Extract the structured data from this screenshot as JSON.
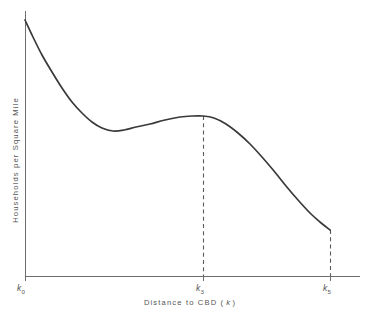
{
  "chart_data": {
    "type": "line",
    "title": "",
    "xlabel": "Distance to CBD ( k )",
    "xlabel_main": "Distance to CBD (",
    "xlabel_symbol": "k",
    "xlabel_close": ")",
    "ylabel": "Households per Square Mile",
    "grid": false,
    "legend": "none",
    "xticks": [
      {
        "label": "k",
        "sub": "0",
        "x_px": 25
      },
      {
        "label": "k",
        "sub": "3",
        "x_px": 203
      },
      {
        "label": "k",
        "sub": "5",
        "x_px": 330
      }
    ],
    "yticks": [],
    "xlim": [
      0,
      5
    ],
    "ylim": [
      0,
      100
    ],
    "annotations": [
      {
        "name": "k3-drop-line",
        "style": "dashed-vertical",
        "x_px": 203,
        "y_top_px": 116,
        "y_bottom_px": 276
      },
      {
        "name": "k5-drop-line",
        "style": "dashed-vertical",
        "x_px": 330,
        "y_top_px": 230,
        "y_bottom_px": 276
      }
    ],
    "series": [
      {
        "name": "household-density",
        "color": "#3a3a3a",
        "points_px": [
          [
            25,
            20
          ],
          [
            33,
            37
          ],
          [
            42,
            55
          ],
          [
            52,
            72
          ],
          [
            62,
            88
          ],
          [
            72,
            102
          ],
          [
            82,
            113
          ],
          [
            92,
            122
          ],
          [
            102,
            128
          ],
          [
            113,
            131
          ],
          [
            124,
            130
          ],
          [
            136,
            127
          ],
          [
            150,
            124
          ],
          [
            165,
            120
          ],
          [
            180,
            117
          ],
          [
            192,
            116
          ],
          [
            203,
            116
          ],
          [
            214,
            118
          ],
          [
            226,
            124
          ],
          [
            238,
            133
          ],
          [
            250,
            144
          ],
          [
            262,
            157
          ],
          [
            274,
            171
          ],
          [
            286,
            186
          ],
          [
            298,
            200
          ],
          [
            310,
            213
          ],
          [
            320,
            222
          ],
          [
            330,
            230
          ]
        ],
        "x_values": [
          0,
          0.23,
          0.48,
          0.76,
          1.04,
          1.32,
          1.6,
          1.88,
          2.16,
          2.46,
          2.77,
          3.11,
          3.5,
          3.92,
          4.34,
          4.68,
          5.0,
          5.31,
          5.65,
          5.99,
          6.33,
          6.67,
          7.01,
          7.35,
          7.69,
          8.03,
          8.31,
          8.59
        ],
        "y_values": [
          100,
          93.4,
          86.3,
          79.7,
          73.5,
          68.1,
          63.8,
          60.3,
          58.0,
          56.8,
          57.2,
          58.4,
          59.5,
          61.0,
          62.2,
          62.6,
          62.7,
          62.0,
          59.7,
          56.2,
          51.9,
          46.9,
          41.4,
          35.7,
          30.4,
          25.4,
          21.9,
          18.8
        ]
      }
    ],
    "features": {
      "start_value_note": "maximum at k0",
      "local_minimum_px": [
        113,
        131
      ],
      "local_maximum_px": [
        203,
        116
      ],
      "endpoint_px": [
        330,
        230
      ]
    },
    "axes_px": {
      "origin_x": 25,
      "origin_y": 276,
      "y_top": 11,
      "x_right": 360
    }
  }
}
